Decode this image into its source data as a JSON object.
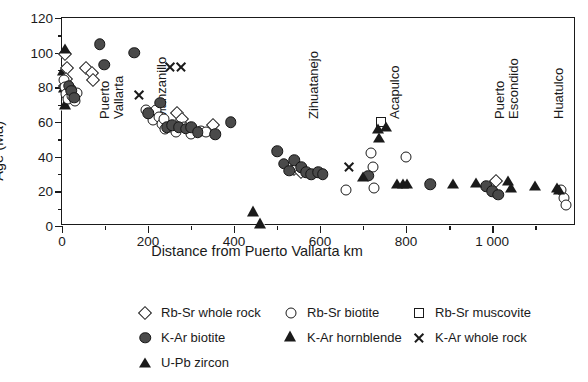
{
  "chart_data": {
    "type": "scatter",
    "title": "",
    "xlabel": "Distance from Puerto Vallarta km",
    "ylabel": "Age (Ma)",
    "xlim": [
      0,
      1195
    ],
    "ylim": [
      0,
      120
    ],
    "x_ticks": [
      0,
      200,
      400,
      600,
      800,
      1000
    ],
    "x_tick_labels": [
      "0",
      "200",
      "400",
      "600",
      "800",
      "1 000"
    ],
    "x_minor_step": 100,
    "y_ticks": [
      0,
      20,
      40,
      60,
      80,
      100,
      120
    ],
    "y_tick_labels": [
      "0",
      "20",
      "40",
      "60",
      "80",
      "100",
      "120"
    ],
    "y_minor_step": 10,
    "grid": false,
    "legend_position": "below-plot",
    "region_labels": [
      {
        "name": "Puerto Vallarta",
        "lines": [
          "Puerto",
          "Vallarta"
        ],
        "x_km": 62
      },
      {
        "name": "Manzanillo",
        "lines": [
          "Manzanillo"
        ],
        "x_km": 196
      },
      {
        "name": "Zihuatanejo",
        "lines": [
          "Zihuatanejo"
        ],
        "x_km": 548
      },
      {
        "name": "Acapulco",
        "lines": [
          "Acapulco"
        ],
        "x_km": 738
      },
      {
        "name": "Puerto Escondido",
        "lines": [
          "Puerto",
          "Escondido"
        ],
        "x_km": 982
      },
      {
        "name": "Huatulco",
        "lines": [
          "Huatulco"
        ],
        "x_km": 1118
      }
    ],
    "series": [
      {
        "name": "Rb-Sr whole rock",
        "marker": "diamond-open",
        "points": [
          [
            6,
            99
          ],
          [
            12,
            91
          ],
          [
            10,
            85
          ],
          [
            8,
            81
          ],
          [
            14,
            78
          ],
          [
            56,
            91
          ],
          [
            70,
            88
          ],
          [
            72,
            84
          ],
          [
            268,
            65
          ],
          [
            280,
            62
          ],
          [
            350,
            58
          ],
          [
            540,
            33
          ],
          [
            556,
            31
          ],
          [
            1008,
            26
          ]
        ]
      },
      {
        "name": "Rb-Sr biotite",
        "marker": "circle-open",
        "points": [
          [
            4,
            84
          ],
          [
            7,
            80
          ],
          [
            10,
            76
          ],
          [
            14,
            73
          ],
          [
            20,
            79
          ],
          [
            24,
            75
          ],
          [
            30,
            72
          ],
          [
            36,
            77
          ],
          [
            196,
            67
          ],
          [
            206,
            64
          ],
          [
            212,
            61
          ],
          [
            218,
            67
          ],
          [
            226,
            63
          ],
          [
            232,
            59
          ],
          [
            238,
            62
          ],
          [
            240,
            56
          ],
          [
            252,
            57
          ],
          [
            264,
            54
          ],
          [
            284,
            57
          ],
          [
            300,
            53
          ],
          [
            322,
            55
          ],
          [
            334,
            54
          ],
          [
            660,
            21
          ],
          [
            718,
            42
          ],
          [
            722,
            34
          ],
          [
            726,
            22
          ],
          [
            800,
            40
          ],
          [
            1160,
            21
          ],
          [
            1166,
            16
          ],
          [
            1172,
            12
          ]
        ]
      },
      {
        "name": "Rb-Sr muscovite",
        "marker": "square-open",
        "points": [
          [
            742,
            60
          ]
        ]
      },
      {
        "name": "K-Ar biotite",
        "marker": "circle-filled",
        "points": [
          [
            16,
            81
          ],
          [
            22,
            78
          ],
          [
            28,
            74
          ],
          [
            88,
            105
          ],
          [
            98,
            93
          ],
          [
            168,
            100
          ],
          [
            200,
            65
          ],
          [
            228,
            71
          ],
          [
            244,
            57
          ],
          [
            256,
            58
          ],
          [
            272,
            57
          ],
          [
            288,
            56
          ],
          [
            300,
            57
          ],
          [
            316,
            54
          ],
          [
            356,
            53
          ],
          [
            392,
            60
          ],
          [
            500,
            43
          ],
          [
            516,
            36
          ],
          [
            528,
            32
          ],
          [
            540,
            38
          ],
          [
            556,
            34
          ],
          [
            568,
            31
          ],
          [
            580,
            30
          ],
          [
            596,
            31
          ],
          [
            606,
            30
          ],
          [
            712,
            29
          ],
          [
            856,
            24
          ],
          [
            986,
            23
          ],
          [
            1000,
            20
          ],
          [
            1014,
            18
          ]
        ]
      },
      {
        "name": "K-Ar hornblende",
        "marker": "triangle-open",
        "points": [
          [
            4,
            89
          ],
          [
            6,
            85
          ],
          [
            8,
            81
          ],
          [
            446,
            25
          ],
          [
            462,
            24
          ]
        ]
      },
      {
        "name": "K-Ar whole rock",
        "marker": "cross",
        "points": [
          [
            178,
            76
          ],
          [
            250,
            92
          ],
          [
            276,
            92
          ],
          [
            668,
            34
          ]
        ]
      },
      {
        "name": "U-Pb zircon",
        "marker": "triangle-filled",
        "points": [
          [
            6,
            102
          ],
          [
            700,
            28
          ],
          [
            734,
            56
          ],
          [
            738,
            51
          ],
          [
            754,
            57
          ],
          [
            780,
            24
          ],
          [
            792,
            24
          ],
          [
            802,
            24
          ],
          [
            908,
            24
          ],
          [
            962,
            25
          ],
          [
            1036,
            26
          ],
          [
            1044,
            22
          ],
          [
            1100,
            23
          ],
          [
            1150,
            22
          ],
          [
            1156,
            21
          ]
        ]
      }
    ]
  },
  "legend": {
    "rows": [
      [
        {
          "label": "Rb-Sr whole rock",
          "marker": "diamond-open"
        },
        {
          "label": "Rb-Sr biotite",
          "marker": "circle-open"
        },
        {
          "label": "Rb-Sr muscovite",
          "marker": "square-open"
        }
      ],
      [
        {
          "label": "K-Ar biotite",
          "marker": "circle-filled"
        },
        {
          "label": "K-Ar hornblende",
          "marker": "triangle-open"
        },
        {
          "label": "K-Ar whole rock",
          "marker": "cross"
        }
      ],
      [
        {
          "label": "U-Pb zircon",
          "marker": "triangle-filled"
        }
      ]
    ]
  }
}
